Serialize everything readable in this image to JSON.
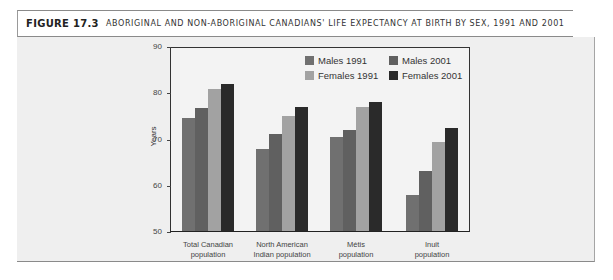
{
  "header": {
    "figure_label": "FIGURE 17.3",
    "title": "ABORIGINAL AND NON-ABORIGINAL CANADIANS' LIFE EXPECTANCY AT BIRTH BY SEX, 1991 AND 2001"
  },
  "chart_data": {
    "type": "bar",
    "title": "Aboriginal and Non-Aboriginal Canadians' Life Expectancy at Birth by Sex, 1991 and 2001",
    "xlabel": "",
    "ylabel": "Years",
    "ylim": [
      50,
      90
    ],
    "yticks": [
      50,
      60,
      70,
      80,
      90
    ],
    "grid": false,
    "legend_position": "top-right inside",
    "categories": [
      "Total Canadian population",
      "North American Indian population",
      "Métis population",
      "Inuit population"
    ],
    "category_lines": [
      [
        "Total Canadian",
        "population"
      ],
      [
        "North American",
        "Indian population"
      ],
      [
        "Métis",
        "population"
      ],
      [
        "Inuit",
        "population"
      ]
    ],
    "series": [
      {
        "name": "Males 1991",
        "color": "#707070",
        "values": [
          74.6,
          68.0,
          70.6,
          58.1
        ]
      },
      {
        "name": "Males 2001",
        "color": "#606060",
        "values": [
          76.9,
          71.1,
          72.1,
          63.1
        ]
      },
      {
        "name": "Females 1991",
        "color": "#a2a2a2",
        "values": [
          80.9,
          75.0,
          77.1,
          69.4
        ]
      },
      {
        "name": "Females 2001",
        "color": "#2a2a2a",
        "values": [
          82.1,
          77.0,
          78.1,
          72.4
        ]
      }
    ]
  }
}
